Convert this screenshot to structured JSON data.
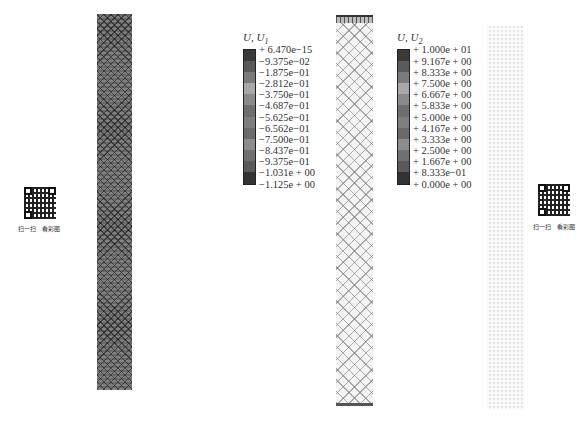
{
  "figure": {
    "legend_u1": {
      "title": "U, U",
      "subscript": "1",
      "entries": [
        "+ 6.470e−15",
        "−9.375e−02",
        "−1.875e−01",
        "−2.812e−01",
        "−3.750e−01",
        "−4.687e−01",
        "−5.625e−01",
        "−6.562e−01",
        "−7.500e−01",
        "−8.437e−01",
        "−9.375e−01",
        "−1.031e + 00",
        "−1.125e + 00"
      ],
      "colors": [
        "#3a3a3a",
        "#5a5a5a",
        "#7a7a7a",
        "#a8a8a8",
        "#8a8a8a",
        "#6e6e6e",
        "#7e7e7e",
        "#6a6a6a",
        "#8c8c8c",
        "#707070",
        "#5a5a5a",
        "#333333"
      ]
    },
    "legend_u2": {
      "title": "U, U",
      "subscript": "2",
      "entries": [
        "+ 1.000e + 01",
        "+ 9.167e + 00",
        "+ 8.333e + 00",
        "+ 7.500e + 00",
        "+ 6.667e + 00",
        "+ 5.833e + 00",
        "+ 5.000e + 00",
        "+ 4.167e + 00",
        "+ 3.333e + 00",
        "+ 2.500e + 00",
        "+ 1.667e + 00",
        "+ 8.333e−01",
        "+ 0.000e + 00"
      ],
      "colors": [
        "#3a3a3a",
        "#5a5a5a",
        "#7a7a7a",
        "#a8a8a8",
        "#8a8a8a",
        "#6e6e6e",
        "#7e7e7e",
        "#6a6a6a",
        "#8c8c8c",
        "#707070",
        "#5a5a5a",
        "#333333"
      ]
    },
    "qr_left": {
      "caption_scan": "扫一扫",
      "caption_view": "看彩图"
    },
    "qr_right": {
      "caption_scan": "扫一扫",
      "caption_view": "看彩图"
    }
  }
}
